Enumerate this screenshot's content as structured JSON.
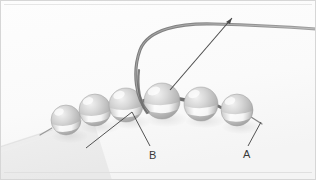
{
  "figure": {
    "kind": "instructional-photograph",
    "background_color": "#fbfbfb",
    "border_color": "#d8d8d8",
    "width": 316,
    "height": 180
  },
  "annotations": {
    "labels": [
      {
        "id": "label-a",
        "text": "A",
        "x": 243,
        "y": 149,
        "points_to": "rightmost-bead-thread-exit"
      },
      {
        "id": "label-b",
        "text": "B",
        "x": 149,
        "y": 150,
        "points_to": "third-bead-from-left"
      }
    ],
    "leader_lines": [
      {
        "name": "leader-line-a",
        "from": [
          248,
          146
        ],
        "to": [
          261,
          122
        ]
      },
      {
        "name": "leader-line-b-left",
        "from": [
          86,
          148
        ],
        "to": [
          132,
          112
        ]
      },
      {
        "name": "leader-line-b-right",
        "from": [
          132,
          112
        ],
        "to": [
          150,
          146
        ]
      },
      {
        "name": "pointer-arrow-to-bead",
        "from": [
          232,
          18
        ],
        "to": [
          170,
          90
        ]
      }
    ]
  },
  "scene": {
    "surface_color": "#f2f2f2",
    "thread_color": "#8a8a8a",
    "beads": [
      {
        "name": "bead-1",
        "cx": 66,
        "cy": 120,
        "r": 15
      },
      {
        "name": "bead-2",
        "cx": 95,
        "cy": 110,
        "r": 16
      },
      {
        "name": "bead-3",
        "cx": 126,
        "cy": 105,
        "r": 17
      },
      {
        "name": "bead-4",
        "cx": 162,
        "cy": 101,
        "r": 18
      },
      {
        "name": "bead-5",
        "cx": 201,
        "cy": 104,
        "r": 17
      },
      {
        "name": "bead-6",
        "cx": 237,
        "cy": 110,
        "r": 16
      }
    ],
    "thread_path_description": "curves up out of bead-4, arcs left then up and right across the top to the right edge",
    "needle_description": "thin straight needle overlying the thread pointing down-left toward bead-4"
  }
}
